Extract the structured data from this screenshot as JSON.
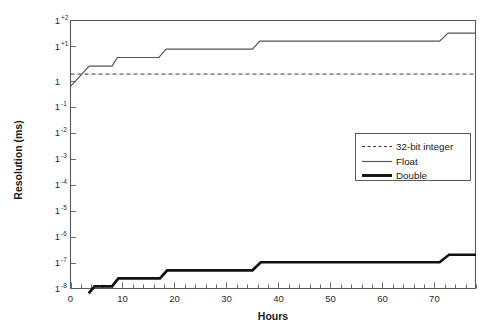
{
  "chart_data": {
    "type": "line",
    "title": "",
    "xlabel": "Hours",
    "ylabel": "Resolution (ms)",
    "xlim": [
      0,
      78
    ],
    "ylim_exponent": [
      -8,
      2
    ],
    "grid": false,
    "legend_position": "center-right",
    "x_ticks": [
      0,
      10,
      20,
      30,
      40,
      50,
      60,
      70
    ],
    "x_minor_tick_step": 2,
    "y_ticks": [
      {
        "base": "1",
        "exp": "+2",
        "value": 2
      },
      {
        "base": "1",
        "exp": "+1",
        "value": 1
      },
      {
        "base": "1",
        "exp": "",
        "value": 0
      },
      {
        "base": "1",
        "exp": "-1",
        "value": -1
      },
      {
        "base": "1",
        "exp": "-2",
        "value": -2
      },
      {
        "base": "1",
        "exp": "-3",
        "value": -3
      },
      {
        "base": "1",
        "exp": "-4",
        "value": -4
      },
      {
        "base": "1",
        "exp": "-5",
        "value": -5
      },
      {
        "base": "1",
        "exp": "-6",
        "value": -6
      },
      {
        "base": "1",
        "exp": "-7",
        "value": -7
      },
      {
        "base": "1",
        "exp": "-8",
        "value": -8
      }
    ],
    "series": [
      {
        "name": "32-bit integer",
        "style": "dotted",
        "points": [
          [
            0,
            0.0
          ],
          [
            78,
            0.0
          ]
        ]
      },
      {
        "name": "Float",
        "style": "thin-solid",
        "points": [
          [
            0,
            -0.46
          ],
          [
            3.6,
            0.3
          ],
          [
            4.6,
            0.3
          ],
          [
            8.0,
            0.3
          ],
          [
            9.0,
            0.62
          ],
          [
            17.0,
            0.62
          ],
          [
            18.4,
            0.93
          ],
          [
            35.0,
            0.93
          ],
          [
            36.4,
            1.23
          ],
          [
            71.0,
            1.23
          ],
          [
            72.6,
            1.53
          ],
          [
            78,
            1.53
          ]
        ]
      },
      {
        "name": "Double",
        "style": "thick-solid",
        "points": [
          [
            3.5,
            -8.18
          ],
          [
            4.6,
            -7.92
          ],
          [
            8.0,
            -7.92
          ],
          [
            9.2,
            -7.62
          ],
          [
            17.2,
            -7.62
          ],
          [
            18.6,
            -7.32
          ],
          [
            35.0,
            -7.32
          ],
          [
            36.6,
            -7.02
          ],
          [
            71.0,
            -7.02
          ],
          [
            72.8,
            -6.74
          ],
          [
            78,
            -6.74
          ]
        ]
      }
    ],
    "legend_entries": [
      {
        "label": "32-bit integer",
        "style": "dotted"
      },
      {
        "label": "Float",
        "style": "thin-solid"
      },
      {
        "label": "Double",
        "style": "thick-solid"
      }
    ],
    "colors": {
      "background": "#ffffff",
      "axis": "#5a5a5a",
      "text": "#1a1a1a",
      "integer_series": "#3a3a3a",
      "float_series": "#555555",
      "double_series": "#111111"
    }
  }
}
